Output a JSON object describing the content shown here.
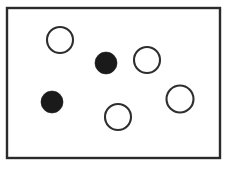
{
  "figure": {
    "kind": "circles-in-frame-diagram",
    "canvas": {
      "width": 227,
      "height": 178,
      "background": "#ffffff"
    },
    "frame": {
      "label": "rectangle-border",
      "x": 7,
      "y": 8,
      "width": 213,
      "height": 150,
      "stroke_color": "#2b2b2b",
      "stroke_width": 2.4,
      "fill_color": "#ffffff"
    },
    "legend": {
      "open_label": "open circle",
      "filled_label": "filled circle",
      "open_count": "4",
      "filled_count": "2",
      "total_count": "6"
    },
    "colors": {
      "outline": "#2e2e2e",
      "fill_black": "#1a1a1a",
      "fill_white": "#ffffff"
    },
    "circles": [
      {
        "id": "circle-open-top-left",
        "type": "open",
        "cx": 60,
        "cy": 40,
        "r": 13.0
      },
      {
        "id": "circle-filled-center-top",
        "type": "filled",
        "cx": 106,
        "cy": 63,
        "r": 11.0
      },
      {
        "id": "circle-open-top-right",
        "type": "open",
        "cx": 147,
        "cy": 60,
        "r": 13.0
      },
      {
        "id": "circle-filled-left",
        "type": "filled",
        "cx": 52,
        "cy": 102,
        "r": 11.0
      },
      {
        "id": "circle-open-bottom-center",
        "type": "open",
        "cx": 118,
        "cy": 117,
        "r": 13.0
      },
      {
        "id": "circle-open-right",
        "type": "open",
        "cx": 180,
        "cy": 99,
        "r": 13.5
      }
    ]
  }
}
